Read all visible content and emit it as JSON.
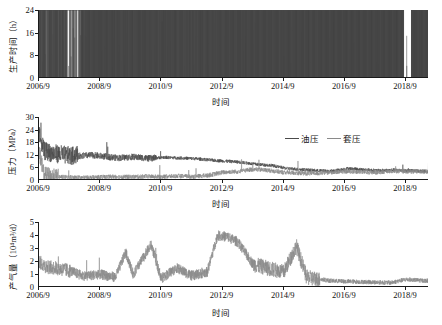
{
  "chart_data": [
    {
      "type": "bar",
      "panel": "production-hours",
      "title": "",
      "ylabel": "生产时间（h）",
      "xlabel": "时间",
      "ylim": [
        0,
        24
      ],
      "yticks": [
        0,
        8,
        16,
        24
      ],
      "xticks": [
        "2006/9",
        "2008/9",
        "2010/9",
        "2012/9",
        "2014/9",
        "2016/9",
        "2018/9"
      ],
      "xlim": [
        "2006/9",
        "2019/6"
      ],
      "grid": false,
      "series_name": "生产时间",
      "color": "#4a4a4a",
      "note": "Daily production hours, mostly 24 h with frequent shut-in (0 h) intervals; dense continuous operation after 2015; a gap just before 2018/9 then resumed at 24 h.",
      "values_by_year_fraction_at_24h": [
        {
          "x": "2006/9",
          "value": 24
        },
        {
          "x": "2007/3",
          "value": 0
        },
        {
          "x": "2007/9",
          "value": 24
        },
        {
          "x": "2008/9",
          "value": 24
        },
        {
          "x": "2009/9",
          "value": 24
        },
        {
          "x": "2010/9",
          "value": 24
        },
        {
          "x": "2011/9",
          "value": 24
        },
        {
          "x": "2012/9",
          "value": 24
        },
        {
          "x": "2013/9",
          "value": 24
        },
        {
          "x": "2014/9",
          "value": 24
        },
        {
          "x": "2015/9",
          "value": 24
        },
        {
          "x": "2016/9",
          "value": 24
        },
        {
          "x": "2017/9",
          "value": 24
        },
        {
          "x": "2018/3",
          "value": 0
        },
        {
          "x": "2018/9",
          "value": 24
        },
        {
          "x": "2019/6",
          "value": 24
        }
      ]
    },
    {
      "type": "line",
      "panel": "pressure",
      "title": "",
      "ylabel": "压力（MPa）",
      "xlabel": "时间",
      "ylim": [
        0,
        30
      ],
      "yticks": [
        0,
        6,
        12,
        18,
        24,
        30
      ],
      "xticks": [
        "2006/9",
        "2008/9",
        "2010/9",
        "2012/9",
        "2014/9",
        "2016/9",
        "2018/9"
      ],
      "xlim": [
        "2006/9",
        "2019/6"
      ],
      "grid": false,
      "legend_position": "top-right",
      "series": [
        {
          "name": "油压",
          "color": "#4a4a4a",
          "points": [
            {
              "x": "2006/9",
              "y": 20.5
            },
            {
              "x": "2006/11",
              "y": 12.5
            },
            {
              "x": "2007/2",
              "y": 11.5
            },
            {
              "x": "2007/6",
              "y": 10.8
            },
            {
              "x": "2007/10",
              "y": 10.0
            },
            {
              "x": "2008/1",
              "y": 11.5
            },
            {
              "x": "2008/6",
              "y": 11.8
            },
            {
              "x": "2008/11",
              "y": 11.2
            },
            {
              "x": "2009/4",
              "y": 10.5
            },
            {
              "x": "2009/10",
              "y": 11.0
            },
            {
              "x": "2010/4",
              "y": 10.3
            },
            {
              "x": "2010/10",
              "y": 10.8
            },
            {
              "x": "2011/4",
              "y": 10.5
            },
            {
              "x": "2011/10",
              "y": 10.2
            },
            {
              "x": "2012/4",
              "y": 9.5
            },
            {
              "x": "2012/10",
              "y": 9.0
            },
            {
              "x": "2013/4",
              "y": 8.5
            },
            {
              "x": "2013/10",
              "y": 7.5
            },
            {
              "x": "2014/4",
              "y": 7.0
            },
            {
              "x": "2014/10",
              "y": 5.5
            },
            {
              "x": "2015/4",
              "y": 5.0
            },
            {
              "x": "2015/10",
              "y": 4.5
            },
            {
              "x": "2016/4",
              "y": 4.2
            },
            {
              "x": "2016/10",
              "y": 5.5
            },
            {
              "x": "2017/4",
              "y": 5.0
            },
            {
              "x": "2017/10",
              "y": 4.5
            },
            {
              "x": "2018/4",
              "y": 4.8
            },
            {
              "x": "2018/10",
              "y": 4.5
            },
            {
              "x": "2019/4",
              "y": 4.2
            }
          ]
        },
        {
          "name": "套压",
          "color": "#8a8a8a",
          "points": [
            {
              "x": "2006/9",
              "y": 14.0
            },
            {
              "x": "2006/11",
              "y": 2.5
            },
            {
              "x": "2007/3",
              "y": 1.5
            },
            {
              "x": "2007/8",
              "y": 1.2
            },
            {
              "x": "2008/2",
              "y": 1.0
            },
            {
              "x": "2008/8",
              "y": 1.2
            },
            {
              "x": "2009/3",
              "y": 1.5
            },
            {
              "x": "2009/9",
              "y": 1.3
            },
            {
              "x": "2010/3",
              "y": 1.6
            },
            {
              "x": "2010/9",
              "y": 1.4
            },
            {
              "x": "2011/3",
              "y": 1.8
            },
            {
              "x": "2011/9",
              "y": 1.5
            },
            {
              "x": "2012/3",
              "y": 2.0
            },
            {
              "x": "2012/9",
              "y": 3.5
            },
            {
              "x": "2013/3",
              "y": 4.0
            },
            {
              "x": "2013/9",
              "y": 5.0
            },
            {
              "x": "2014/3",
              "y": 4.5
            },
            {
              "x": "2014/9",
              "y": 3.5
            },
            {
              "x": "2015/3",
              "y": 3.2
            },
            {
              "x": "2015/9",
              "y": 3.0
            },
            {
              "x": "2016/3",
              "y": 3.5
            },
            {
              "x": "2016/9",
              "y": 4.0
            },
            {
              "x": "2017/3",
              "y": 3.8
            },
            {
              "x": "2017/9",
              "y": 3.5
            },
            {
              "x": "2018/3",
              "y": 4.2
            },
            {
              "x": "2018/9",
              "y": 4.0
            },
            {
              "x": "2019/4",
              "y": 3.8
            }
          ]
        }
      ],
      "note": "Tubing pressure (油压) starts near 20 MPa with spikes to 24 MPa, declines to ~4 MPa; casing pressure (套压) mostly 0–5 MPa with a 14 MPa initial value."
    },
    {
      "type": "line",
      "panel": "gas-rate",
      "title": "",
      "ylabel": "产气量（10⁴m³/d）",
      "xlabel": "时间",
      "ylim": [
        0,
        5
      ],
      "yticks": [
        0,
        1,
        2,
        3,
        4,
        5
      ],
      "xticks": [
        "2006/9",
        "2008/9",
        "2010/9",
        "2012/9",
        "2014/9",
        "2016/9",
        "2018/9"
      ],
      "xlim": [
        "2006/9",
        "2019/6"
      ],
      "grid": false,
      "series_name": "产气量",
      "color": "#8a8a8a",
      "points": [
        {
          "x": "2006/9",
          "y": 2.0
        },
        {
          "x": "2006/12",
          "y": 1.6
        },
        {
          "x": "2007/4",
          "y": 1.5
        },
        {
          "x": "2007/9",
          "y": 1.3
        },
        {
          "x": "2008/2",
          "y": 0.9
        },
        {
          "x": "2008/9",
          "y": 1.0
        },
        {
          "x": "2009/3",
          "y": 0.8
        },
        {
          "x": "2009/7",
          "y": 2.7
        },
        {
          "x": "2009/10",
          "y": 1.0
        },
        {
          "x": "2010/5",
          "y": 3.3
        },
        {
          "x": "2010/9",
          "y": 0.7
        },
        {
          "x": "2011/3",
          "y": 1.5
        },
        {
          "x": "2011/9",
          "y": 0.9
        },
        {
          "x": "2012/3",
          "y": 1.2
        },
        {
          "x": "2012/7",
          "y": 4.0
        },
        {
          "x": "2012/11",
          "y": 3.9
        },
        {
          "x": "2013/3",
          "y": 3.5
        },
        {
          "x": "2013/9",
          "y": 1.8
        },
        {
          "x": "2014/3",
          "y": 1.5
        },
        {
          "x": "2014/9",
          "y": 1.2
        },
        {
          "x": "2015/2",
          "y": 3.2
        },
        {
          "x": "2015/6",
          "y": 0.8
        },
        {
          "x": "2016/3",
          "y": 0.5
        },
        {
          "x": "2016/9",
          "y": 0.45
        },
        {
          "x": "2017/6",
          "y": 0.4
        },
        {
          "x": "2018/3",
          "y": 0.35
        },
        {
          "x": "2018/9",
          "y": 0.6
        },
        {
          "x": "2019/4",
          "y": 0.5
        }
      ],
      "note": "Daily gas rate, highly variable 0–4 ×10⁴ m³/d, peaking around 2012/9–2013, declining below 1 after 2015."
    }
  ],
  "panels": {
    "hours": {
      "ylabel": "生产时间（h）",
      "xlabel": "时间",
      "yticks": [
        "24",
        "16",
        "8",
        "0"
      ],
      "xticks": [
        "2006/9",
        "2008/9",
        "2010/9",
        "2012/9",
        "2014/9",
        "2016/9",
        "2018/9"
      ]
    },
    "pressure": {
      "ylabel": "压力（MPa）",
      "xlabel": "时间",
      "yticks": [
        "30",
        "24",
        "18",
        "12",
        "6",
        "0"
      ],
      "xticks": [
        "2006/9",
        "2008/9",
        "2010/9",
        "2012/9",
        "2014/9",
        "2016/9",
        "2018/9"
      ],
      "legend": [
        {
          "label": "油压",
          "color": "#4a4a4a"
        },
        {
          "label": "套压",
          "color": "#8a8a8a"
        }
      ]
    },
    "gas": {
      "ylabel_prefix": "产气量（10",
      "ylabel_sup": "4",
      "ylabel_suffix": "m³/d）",
      "ylabel": "产气量（10⁴m³/d）",
      "xlabel": "时间",
      "yticks": [
        "5",
        "4",
        "3",
        "2",
        "1",
        "0"
      ],
      "xticks": [
        "2006/9",
        "2008/9",
        "2010/9",
        "2012/9",
        "2014/9",
        "2016/9",
        "2018/9"
      ]
    }
  },
  "colors": {
    "axis": "#1a1a1a",
    "series_dark": "#4a4a4a",
    "series_light": "#8a8a8a",
    "background": "#ffffff"
  }
}
